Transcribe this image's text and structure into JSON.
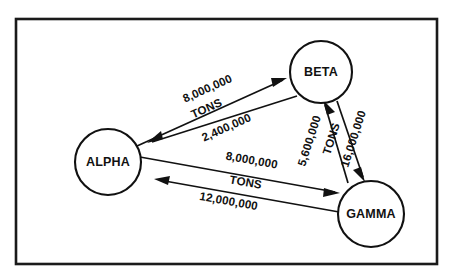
{
  "diagram": {
    "frame": {
      "name": "outer-border",
      "color": "#1a1a1a"
    },
    "unit_label": "TONS",
    "nodes": [
      {
        "id": "alpha",
        "label": "ALPHA",
        "cx": 108,
        "cy": 162,
        "r": 33
      },
      {
        "id": "beta",
        "label": "BETA",
        "cx": 321,
        "cy": 72,
        "r": 31
      },
      {
        "id": "gamma",
        "label": "GAMMA",
        "cx": 371,
        "cy": 214,
        "r": 33
      }
    ],
    "edges": [
      {
        "id": "alpha-to-beta",
        "from": "ALPHA",
        "to": "BETA",
        "value": "8,000,000",
        "unit": "TONS",
        "value_numeric": 8000000
      },
      {
        "id": "beta-to-alpha",
        "from": "BETA",
        "to": "ALPHA",
        "value": "2,400,000",
        "unit": "TONS",
        "value_numeric": 2400000
      },
      {
        "id": "alpha-to-gamma",
        "from": "ALPHA",
        "to": "GAMMA",
        "value": "8,000,000",
        "unit": "TONS",
        "value_numeric": 8000000
      },
      {
        "id": "gamma-to-alpha",
        "from": "GAMMA",
        "to": "ALPHA",
        "value": "12,000,000",
        "unit": "TONS",
        "value_numeric": 12000000
      },
      {
        "id": "beta-to-gamma",
        "from": "BETA",
        "to": "GAMMA",
        "value": "16,000,000",
        "unit": "TONS",
        "value_numeric": 16000000
      },
      {
        "id": "gamma-to-beta",
        "from": "GAMMA",
        "to": "BETA",
        "value": "5,600,000",
        "unit": "TONS",
        "value_numeric": 5600000
      }
    ],
    "labels": {
      "alpha_beta_top": "8,000,000",
      "alpha_beta_mid": "TONS",
      "alpha_beta_bottom": "2,400,000",
      "alpha_gamma_top": "8,000,000",
      "alpha_gamma_mid": "TONS",
      "alpha_gamma_bottom": "12,000,000",
      "beta_gamma_left": "5,600,000",
      "beta_gamma_mid": "TONS",
      "beta_gamma_right": "16,000,000"
    }
  }
}
